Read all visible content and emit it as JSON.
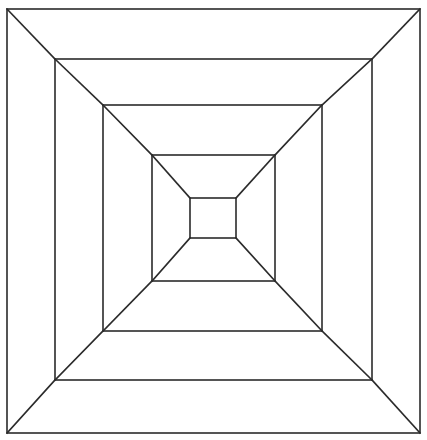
{
  "figure": {
    "canvas": {
      "width": 427,
      "height": 440
    },
    "background_color": "#ffffff",
    "stroke_color": "#2b2b2b",
    "stroke_width": 1.6,
    "fill": "none",
    "squares": [
      {
        "name": "square-1-outer",
        "index": 1,
        "left": 7,
        "top": 9,
        "right": 420,
        "bottom": 433,
        "width": 413,
        "height": 424
      },
      {
        "name": "square-2",
        "index": 2,
        "left": 55,
        "top": 59,
        "right": 372,
        "bottom": 380,
        "width": 317,
        "height": 321
      },
      {
        "name": "square-3",
        "index": 3,
        "left": 103,
        "top": 105,
        "right": 322,
        "bottom": 331,
        "width": 219,
        "height": 226
      },
      {
        "name": "square-4",
        "index": 4,
        "left": 152,
        "top": 155,
        "right": 275,
        "bottom": 281,
        "width": 123,
        "height": 126
      },
      {
        "name": "square-5-inner",
        "index": 5,
        "left": 190,
        "top": 198,
        "right": 236,
        "bottom": 238,
        "width": 46,
        "height": 40
      }
    ],
    "diagonals": [
      {
        "name": "diagonal-tl-1-2",
        "corner": "top-left",
        "from_square": 1,
        "to_square": 2,
        "x1": 7,
        "y1": 9,
        "x2": 55,
        "y2": 59
      },
      {
        "name": "diagonal-tr-1-2",
        "corner": "top-right",
        "from_square": 1,
        "to_square": 2,
        "x1": 420,
        "y1": 9,
        "x2": 372,
        "y2": 59
      },
      {
        "name": "diagonal-br-1-2",
        "corner": "bottom-right",
        "from_square": 1,
        "to_square": 2,
        "x1": 420,
        "y1": 433,
        "x2": 372,
        "y2": 380
      },
      {
        "name": "diagonal-bl-1-2",
        "corner": "bottom-left",
        "from_square": 1,
        "to_square": 2,
        "x1": 7,
        "y1": 433,
        "x2": 55,
        "y2": 380
      },
      {
        "name": "diagonal-tl-2-3",
        "corner": "top-left",
        "from_square": 2,
        "to_square": 3,
        "x1": 55,
        "y1": 59,
        "x2": 103,
        "y2": 105
      },
      {
        "name": "diagonal-tr-2-3",
        "corner": "top-right",
        "from_square": 2,
        "to_square": 3,
        "x1": 372,
        "y1": 59,
        "x2": 322,
        "y2": 105
      },
      {
        "name": "diagonal-br-2-3",
        "corner": "bottom-right",
        "from_square": 2,
        "to_square": 3,
        "x1": 372,
        "y1": 380,
        "x2": 322,
        "y2": 331
      },
      {
        "name": "diagonal-bl-2-3",
        "corner": "bottom-left",
        "from_square": 2,
        "to_square": 3,
        "x1": 55,
        "y1": 380,
        "x2": 103,
        "y2": 331
      },
      {
        "name": "diagonal-tl-3-4",
        "corner": "top-left",
        "from_square": 3,
        "to_square": 4,
        "x1": 103,
        "y1": 105,
        "x2": 152,
        "y2": 155
      },
      {
        "name": "diagonal-tr-3-4",
        "corner": "top-right",
        "from_square": 3,
        "to_square": 4,
        "x1": 322,
        "y1": 105,
        "x2": 275,
        "y2": 155
      },
      {
        "name": "diagonal-br-3-4",
        "corner": "bottom-right",
        "from_square": 3,
        "to_square": 4,
        "x1": 322,
        "y1": 331,
        "x2": 275,
        "y2": 281
      },
      {
        "name": "diagonal-bl-3-4",
        "corner": "bottom-left",
        "from_square": 3,
        "to_square": 4,
        "x1": 103,
        "y1": 331,
        "x2": 152,
        "y2": 281
      },
      {
        "name": "diagonal-tl-4-5",
        "corner": "top-left",
        "from_square": 4,
        "to_square": 5,
        "x1": 152,
        "y1": 155,
        "x2": 190,
        "y2": 198
      },
      {
        "name": "diagonal-tr-4-5",
        "corner": "top-right",
        "from_square": 4,
        "to_square": 5,
        "x1": 275,
        "y1": 155,
        "x2": 236,
        "y2": 198
      },
      {
        "name": "diagonal-br-4-5",
        "corner": "bottom-right",
        "from_square": 4,
        "to_square": 5,
        "x1": 275,
        "y1": 281,
        "x2": 236,
        "y2": 238
      },
      {
        "name": "diagonal-bl-4-5",
        "corner": "bottom-left",
        "from_square": 4,
        "to_square": 5,
        "x1": 152,
        "y1": 281,
        "x2": 190,
        "y2": 238
      }
    ]
  }
}
